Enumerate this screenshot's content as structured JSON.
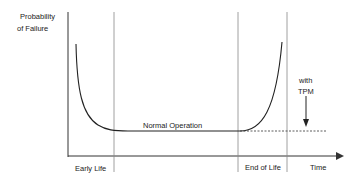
{
  "diagram": {
    "y_axis_label_line1": "Probability",
    "y_axis_label_line2": "of Failure",
    "x_axis_label": "Time",
    "phase_labels": [
      "Early Life",
      "End of Life"
    ],
    "curve_label": "Normal Operation",
    "annotation_line1": "with",
    "annotation_line2": "TPM",
    "colors": {
      "line": "#222222",
      "guide": "#888888"
    }
  }
}
